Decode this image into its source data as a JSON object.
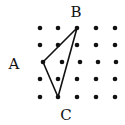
{
  "diagram": {
    "type": "dot-grid-triangle",
    "grid": {
      "rows": [
        {
          "y": 28,
          "xs": [
            40,
            58,
            77,
            96,
            115
          ]
        },
        {
          "y": 45,
          "xs": [
            40,
            58,
            77,
            96,
            115
          ]
        },
        {
          "y": 62,
          "xs": [
            43,
            62,
            80,
            98,
            116
          ]
        },
        {
          "y": 79,
          "xs": [
            40,
            58,
            77,
            96,
            115
          ]
        },
        {
          "y": 97,
          "xs": [
            40,
            58,
            77,
            96,
            115
          ]
        }
      ],
      "dot_color": "#111111"
    },
    "vertices": {
      "A": {
        "label": "A",
        "x": 43,
        "y": 62,
        "label_x": 14,
        "label_y": 69
      },
      "B": {
        "label": "B",
        "x": 77,
        "y": 28,
        "label_x": 76,
        "label_y": 17
      },
      "C": {
        "label": "C",
        "x": 58,
        "y": 97,
        "label_x": 66,
        "label_y": 120
      }
    },
    "line_color": "#111111"
  }
}
